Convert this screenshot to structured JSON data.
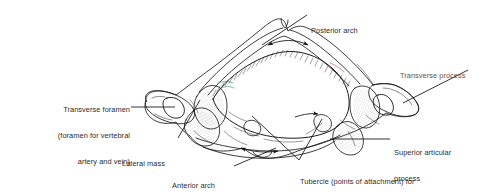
{
  "figure": {
    "background_color": "#ffffff",
    "ink_color": "#1a1a1a",
    "label_color": "#2b2b2b",
    "accent_label_color": "#6d5245"
  },
  "labels": {
    "posterior_arch": {
      "line1": "Posterior arch"
    },
    "transverse_process": {
      "line1": "Transverse process"
    },
    "transverse_foramen": {
      "line1": "Transverse foramen",
      "line2": "(foramen for vertebral",
      "line3": "artery and vein)"
    },
    "superior_articular_process": {
      "line1": "Superior articular",
      "line2": "process"
    },
    "lateral_mass": {
      "line1": "Lateral mass"
    },
    "anterior_arch": {
      "line1": "Anterior arch"
    },
    "tubercle": {
      "line1": "Tubercle (points of attachment) for",
      "line2": "tranverse atlantal ligament"
    }
  }
}
